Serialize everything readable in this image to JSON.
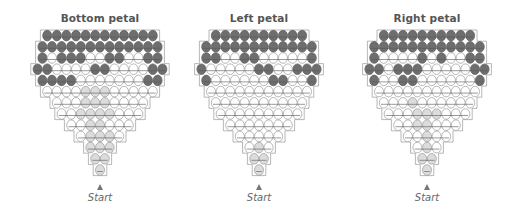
{
  "colors": {
    "dark": "#6e6e6e",
    "dark_stroke": "#5a5a5a",
    "light": "#ffffff",
    "light_stroke": "#9a9a9a",
    "grey": "#dcdcdc",
    "grey_stroke": "#9a9a9a",
    "thread": "#555555",
    "outline": "#9a9a9a"
  },
  "start_label": "Start",
  "panels": [
    {
      "title": "Bottom petal",
      "center_x": 100,
      "rows": [
        "DDDDDDDDDDDD",
        "DDDDDDDDDDDDD",
        "DLDDDLLDDLLDD",
        "DDLLLLDDLLLLDD",
        "DDDDLLLLLLLDD",
        "LLLLGGGLLLLL",
        "LLLGGGLLLL",
        "LLGGGGLLL",
        "LLGGLLL",
        "LGGGL",
        "GGG",
        "GG",
        "G"
      ]
    },
    {
      "title": "Left petal",
      "center_x": 259,
      "rows": [
        "DDDDDDDDDD",
        "DDDDDDDDDDDD",
        "DDLLDDLLLLLD",
        "DLLLLLDDLLDDD",
        "DLLLLLLDDLLD",
        "LLLLLLLLLLL",
        "LLLLLLLLLL",
        "LLLLLLLLL",
        "LLLLLLL",
        "LLLLL",
        "LGL",
        "GG",
        "G"
      ]
    },
    {
      "title": "Right petal",
      "center_x": 427,
      "rows": [
        "DDDDDDDDDD",
        "DDDDDDDDDDDD",
        "DLLLLDLDLLDD",
        "DDLDDDLLLLLDD",
        "DLLDDLLLLLLD",
        "LLLLLLLLLLL",
        "LLLGLLLLLL",
        "LLLGGGLLL",
        "LLGGLLL",
        "LLGLL",
        "LGL",
        "GG",
        "G"
      ]
    }
  ]
}
